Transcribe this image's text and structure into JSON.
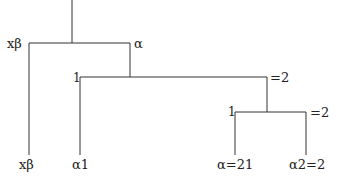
{
  "tree": {
    "nodes": {
      "root_left": "xβ",
      "root_right": "α",
      "mid_left": "1",
      "mid_right": "=2",
      "low_left": "1",
      "low_right": "=2"
    },
    "leaves": [
      "xβ",
      "α1",
      "α=21",
      "α2=2"
    ]
  },
  "colors": {
    "line": "#333333",
    "text": "#222222"
  }
}
